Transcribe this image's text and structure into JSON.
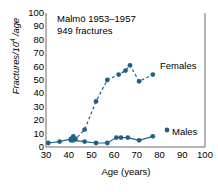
{
  "chart_data": {
    "type": "line",
    "title": "",
    "annotations": [
      "Malmö 1953–1957",
      "949 fractures"
    ],
    "xlabel": "Age (years)",
    "ylabel": "Fractures/10⁴ /age",
    "xlim": [
      30,
      100
    ],
    "ylim": [
      0,
      100
    ],
    "xticks": [
      30,
      40,
      50,
      60,
      70,
      80,
      90,
      100
    ],
    "yticks": [
      0,
      10,
      20,
      30,
      40,
      50,
      60,
      70,
      80,
      90,
      100
    ],
    "grid": false,
    "legend_position": "inline-right",
    "marker_color": "#1f6189",
    "series": [
      {
        "name": "Females",
        "linestyle": "dashed",
        "color": "#1f6189",
        "x": [
          41,
          42,
          43,
          47,
          52,
          57,
          62,
          65,
          67,
          71,
          77
        ],
        "y": [
          5,
          8,
          6,
          13,
          34,
          50,
          54,
          57,
          61,
          49,
          54
        ]
      },
      {
        "name": "Males",
        "linestyle": "solid",
        "color": "#1f6189",
        "x": [
          31,
          36,
          41,
          42,
          47,
          52,
          57,
          61,
          63,
          66,
          71,
          77
        ],
        "y": [
          3,
          4,
          6,
          5,
          4,
          3,
          3,
          7,
          7,
          7,
          5,
          8
        ]
      }
    ]
  },
  "axes": {
    "y_label_text": "Fractures/10",
    "y_label_sup": "4",
    "y_label_tail": " /age",
    "x_label_text": "Age (years)"
  },
  "labels": {
    "females": "Females",
    "males": "Males"
  },
  "annotations": {
    "line1": "Malmö 1953–1957",
    "line2": "949 fractures"
  }
}
